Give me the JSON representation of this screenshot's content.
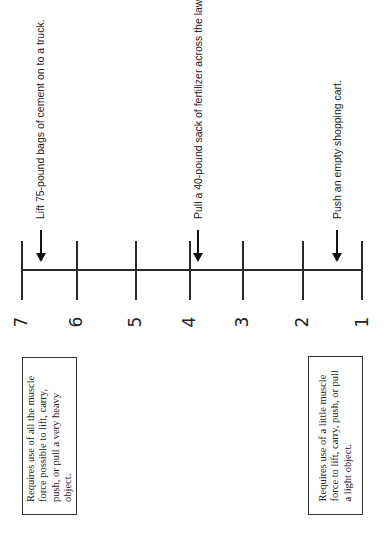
{
  "figure": {
    "orientation": "rotated 90 degrees counter-clockwise",
    "scale": {
      "points": [
        "7",
        "6",
        "5",
        "4",
        "3",
        "2",
        "1"
      ],
      "line_color": "#2a2a2a"
    },
    "anchors": [
      {
        "level": "7",
        "text": "Lift 75-pound bags of cement on to a truck."
      },
      {
        "level": "4",
        "text": "Pull a 40-pound sack of fertilizer across the lawn."
      },
      {
        "level": "1.5",
        "text": "Push an empty shopping cart."
      }
    ],
    "boxes": {
      "high": "Requires use of all the muscle force possible to lift, carry, push, or pull a very heavy object.",
      "low": "Requires use of a little muscle force to lift, carry, push, or pull a light object."
    }
  }
}
